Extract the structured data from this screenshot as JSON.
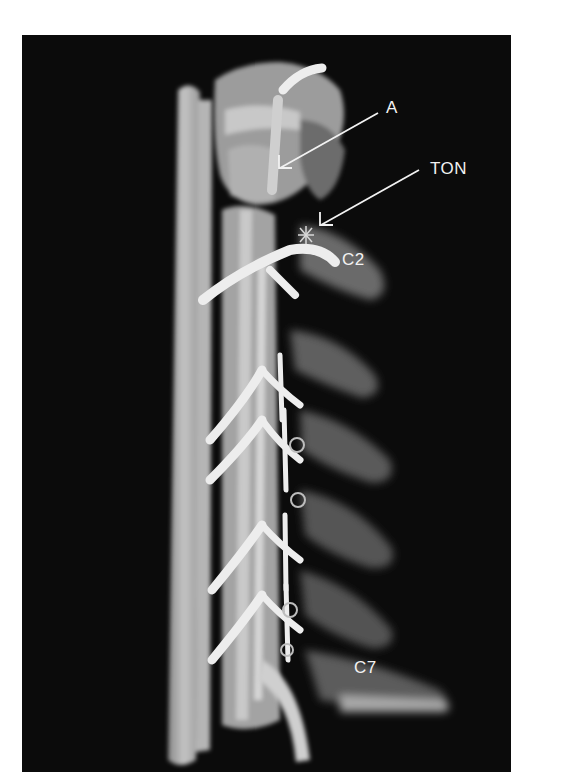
{
  "figure": {
    "background_color": "#0b0b0b",
    "labels": [
      {
        "id": "a",
        "text": "A",
        "x": 386,
        "y": 99
      },
      {
        "id": "ton",
        "text": "TON",
        "x": 430,
        "y": 160
      },
      {
        "id": "c2",
        "text": "C2",
        "x": 342,
        "y": 251
      },
      {
        "id": "c7",
        "text": "C7",
        "x": 354,
        "y": 659
      }
    ],
    "arrows": [
      {
        "id": "arrow-a",
        "from": [
          378,
          113
        ],
        "to": [
          279,
          168
        ]
      },
      {
        "id": "arrow-ton",
        "from": [
          419,
          170
        ],
        "to": [
          320,
          225
        ]
      }
    ]
  }
}
